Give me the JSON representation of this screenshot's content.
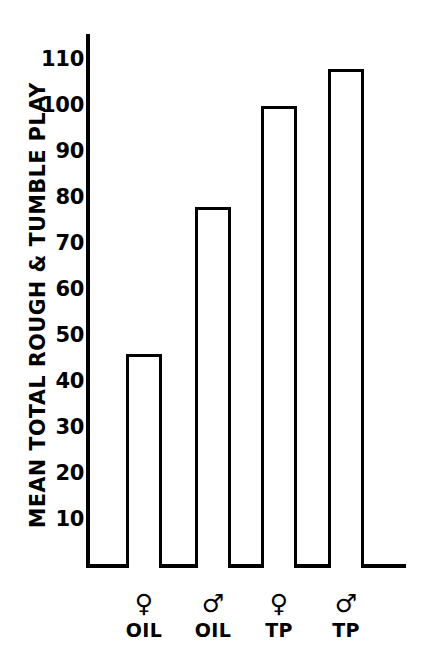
{
  "chart_data": {
    "type": "bar",
    "title": "",
    "subtitle": "",
    "xlabel": "",
    "ylabel": "MEAN TOTAL ROUGH & TUMBLE PLAY",
    "categories": [
      "♀ OIL",
      "♂ OIL",
      "♀ TP",
      "♂ TP"
    ],
    "values": [
      46,
      78,
      100,
      108
    ],
    "ylim": [
      0,
      115
    ],
    "y_ticks": [
      110,
      100,
      90,
      80,
      70,
      60,
      50,
      40,
      30,
      20,
      10
    ],
    "y_tick_labels": [
      "110",
      "100",
      "90",
      "80",
      "70",
      "60",
      "50",
      "40",
      "30",
      "20",
      "10"
    ],
    "grid": false,
    "legend": null,
    "bar_style": "outline",
    "bar_fill": "#ffffff",
    "bar_edge_color": "#000000",
    "axis_color": "#000000",
    "background": "#ffffff",
    "x_tick_groups": [
      {
        "symbol": "♀",
        "symbol_name": "female-symbol",
        "treatment": "OIL",
        "value": 46
      },
      {
        "symbol": "♂",
        "symbol_name": "male-symbol",
        "treatment": "OIL",
        "value": 78
      },
      {
        "symbol": "♀",
        "symbol_name": "female-symbol",
        "treatment": "TP",
        "value": 100
      },
      {
        "symbol": "♂",
        "symbol_name": "male-symbol",
        "treatment": "TP",
        "value": 108
      }
    ]
  },
  "axis": {
    "y_title": "MEAN TOTAL ROUGH & TUMBLE PLAY"
  },
  "ticks": {
    "y": [
      "110",
      "100",
      "90",
      "80",
      "70",
      "60",
      "50",
      "40",
      "30",
      "20",
      "10"
    ]
  },
  "xlabels": [
    {
      "symbol": "♀",
      "treatment": "OIL"
    },
    {
      "symbol": "♂",
      "treatment": "OIL"
    },
    {
      "symbol": "♀",
      "treatment": "TP"
    },
    {
      "symbol": "♂",
      "treatment": "TP"
    }
  ]
}
